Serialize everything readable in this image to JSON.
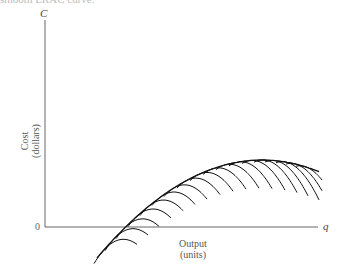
{
  "header_fragment": "smooth LRAC curve.",
  "chart_data": {
    "type": "line",
    "title": "",
    "xlabel": "Output (units)",
    "ylabel": "Cost (dollars)",
    "x_axis_symbol": "q",
    "y_axis_symbol": "C",
    "origin_label": "0",
    "grid": false,
    "legend": null,
    "envelope": {
      "name": "LRAC",
      "points_px": [
        [
          97,
          67
        ],
        [
          120,
          94
        ],
        [
          150,
          120
        ],
        [
          180,
          137
        ],
        [
          210,
          149
        ],
        [
          240,
          157
        ],
        [
          260,
          160
        ],
        [
          285,
          159
        ],
        [
          305,
          156
        ],
        [
          320,
          151
        ]
      ]
    },
    "short_run_curves": {
      "count": 18,
      "tangent_x_px": [
        103,
        114,
        125,
        137,
        149,
        161,
        173,
        186,
        199,
        212,
        225,
        238,
        251,
        263,
        274,
        285,
        295,
        305
      ]
    }
  },
  "labels": {
    "y_symbol": "C",
    "x_symbol": "q",
    "origin": "0",
    "y_title_1": "Cost",
    "y_title_2": "(dollars)",
    "x_title_1": "Output",
    "x_title_2": "(units)"
  }
}
